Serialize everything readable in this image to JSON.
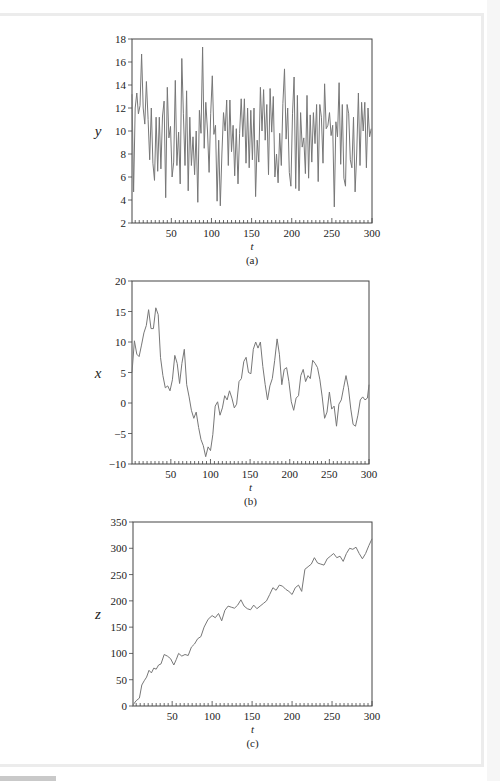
{
  "chart_data": [
    {
      "id": "a",
      "type": "line",
      "caption": "(a)",
      "xlabel": "t",
      "ylabel": "y",
      "xlim": [
        1,
        300
      ],
      "ylim": [
        2,
        18
      ],
      "xticks": [
        50,
        100,
        150,
        200,
        250,
        300
      ],
      "yticks": [
        2,
        4,
        6,
        8,
        10,
        12,
        14,
        16,
        18
      ],
      "grid": false,
      "line_color": "#777777",
      "box": {
        "left": 132,
        "top": 39,
        "right": 372,
        "bottom": 223
      },
      "x": [
        1,
        3,
        5,
        7,
        9,
        11,
        13,
        15,
        17,
        19,
        21,
        23,
        25,
        27,
        29,
        31,
        33,
        35,
        37,
        39,
        41,
        43,
        45,
        47,
        49,
        51,
        53,
        55,
        57,
        59,
        61,
        63,
        65,
        67,
        69,
        71,
        73,
        75,
        77,
        79,
        81,
        83,
        85,
        87,
        89,
        91,
        93,
        95,
        97,
        99,
        101,
        103,
        105,
        107,
        109,
        111,
        113,
        115,
        117,
        119,
        121,
        123,
        125,
        127,
        129,
        131,
        133,
        135,
        137,
        139,
        141,
        143,
        145,
        147,
        149,
        151,
        153,
        155,
        157,
        159,
        161,
        163,
        165,
        167,
        169,
        171,
        173,
        175,
        177,
        179,
        181,
        183,
        185,
        187,
        189,
        191,
        193,
        195,
        197,
        199,
        201,
        203,
        205,
        207,
        209,
        211,
        213,
        215,
        217,
        219,
        221,
        223,
        225,
        227,
        229,
        231,
        233,
        235,
        237,
        239,
        241,
        243,
        245,
        247,
        249,
        251,
        253,
        255,
        257,
        259,
        261,
        263,
        265,
        267,
        269,
        271,
        273,
        275,
        277,
        279,
        281,
        283,
        285,
        287,
        289,
        291,
        293,
        295,
        297,
        299
      ],
      "values": [
        13.2,
        4.7,
        12,
        13.3,
        11.5,
        12.2,
        16.7,
        12,
        10.6,
        14.3,
        11,
        7.5,
        12,
        7.2,
        5.7,
        11.2,
        6.5,
        11.2,
        6.7,
        11.3,
        12.6,
        4.2,
        13.8,
        9.4,
        10.4,
        6,
        7.3,
        14.4,
        7,
        9.9,
        5.4,
        16.3,
        11.5,
        7,
        13.5,
        4.8,
        11.2,
        7,
        9.5,
        6.2,
        10,
        3.8,
        11.8,
        9.8,
        17.3,
        8.5,
        12.5,
        10,
        6.4,
        11.5,
        14.8,
        9.7,
        10.5,
        3.9,
        9.2,
        3.5,
        8,
        11.6,
        10,
        12.7,
        7,
        12.7,
        8.2,
        10.5,
        6.1,
        10.2,
        5.4,
        9.8,
        12.8,
        9.5,
        12.8,
        7.2,
        12,
        6.8,
        11.8,
        7.5,
        12,
        4.3,
        9.2,
        7.3,
        13.8,
        10,
        13.6,
        9.2,
        12.3,
        6.2,
        13.7,
        9.9,
        13,
        6,
        8,
        5.5,
        9.8,
        7,
        12.4,
        15.4,
        9.3,
        12,
        6.4,
        5.2,
        11.5,
        14.7,
        5,
        13.1,
        4.8,
        11.6,
        8.6,
        9.4,
        6.3,
        13.1,
        5.9,
        11.4,
        7.3,
        11.6,
        8.9,
        12.3,
        5.6,
        12.3,
        11.2,
        7.2,
        14.1,
        10.2,
        10.5,
        11.6,
        9.6,
        10.5,
        3.4,
        10.8,
        9.5,
        14.2,
        7.1,
        12.3,
        5.9,
        5.2,
        12.3,
        11.5,
        7.5,
        6.8,
        11.2,
        4.7,
        8,
        13.3,
        7,
        12.5,
        10,
        12.5,
        6.8,
        12,
        9.5,
        10.2,
        3.9,
        10.3,
        6.7,
        8.2
      ]
    },
    {
      "id": "b",
      "type": "line",
      "caption": "(b)",
      "xlabel": "t",
      "ylabel": "x",
      "xlim": [
        1,
        300
      ],
      "ylim": [
        -10,
        20
      ],
      "xticks": [
        50,
        100,
        150,
        200,
        250,
        300
      ],
      "yticks": [
        -10,
        -5,
        0,
        5,
        10,
        15,
        20
      ],
      "grid": false,
      "line_color": "#777777",
      "box": {
        "left": 132,
        "top": 281,
        "right": 369,
        "bottom": 464
      },
      "x": [
        1,
        4,
        7,
        10,
        13,
        16,
        19,
        22,
        25,
        28,
        31,
        34,
        37,
        40,
        43,
        46,
        49,
        52,
        55,
        58,
        61,
        64,
        67,
        70,
        73,
        76,
        79,
        82,
        85,
        88,
        91,
        94,
        97,
        100,
        103,
        106,
        109,
        112,
        115,
        118,
        121,
        124,
        127,
        130,
        133,
        136,
        139,
        142,
        145,
        148,
        151,
        154,
        157,
        160,
        163,
        166,
        169,
        172,
        175,
        178,
        181,
        184,
        187,
        190,
        193,
        196,
        199,
        202,
        205,
        208,
        211,
        214,
        217,
        220,
        223,
        226,
        229,
        232,
        235,
        238,
        241,
        244,
        247,
        250,
        253,
        256,
        259,
        262,
        265,
        268,
        271,
        274,
        277,
        280,
        283,
        286,
        289,
        292,
        295,
        298,
        300
      ],
      "values": [
        5,
        10.2,
        8,
        7.6,
        9.5,
        11.5,
        12.7,
        15.3,
        12.2,
        12.2,
        15.6,
        14.5,
        7.5,
        4.5,
        2.5,
        2.8,
        2,
        3.8,
        7.8,
        6.5,
        3.2,
        6.5,
        8.8,
        3,
        1,
        -1.2,
        -2.5,
        -1.5,
        -4,
        -6,
        -7,
        -8.8,
        -7.2,
        -7.8,
        -5.2,
        -0.5,
        0.2,
        -2,
        -0.8,
        1.2,
        0.5,
        2,
        0.8,
        -0.8,
        -0.2,
        3.5,
        4,
        6.8,
        7.5,
        5,
        4.8,
        8.8,
        10,
        9,
        10,
        6,
        3,
        0.5,
        2.8,
        4,
        7,
        10.5,
        8,
        3,
        5.5,
        5.8,
        3.5,
        0.2,
        -1.2,
        0.8,
        1.2,
        4.5,
        5.5,
        3.5,
        4.5,
        4,
        7,
        6.5,
        5.8,
        3.8,
        1,
        -2.5,
        -1.5,
        1.8,
        -1,
        -0.5,
        -3.8,
        -0.2,
        0.5,
        2.5,
        4.5,
        2.5,
        -1,
        -3.5,
        -3.8,
        -2,
        0.5,
        1,
        0.5,
        0.8,
        3
      ]
    },
    {
      "id": "c",
      "type": "line",
      "caption": "(c)",
      "xlabel": "t",
      "ylabel": "z",
      "xlim": [
        1,
        300
      ],
      "ylim": [
        0,
        350
      ],
      "xticks": [
        50,
        100,
        150,
        200,
        250,
        300
      ],
      "yticks": [
        0,
        50,
        100,
        150,
        200,
        250,
        300,
        350
      ],
      "grid": false,
      "line_color": "#777777",
      "box": {
        "left": 133,
        "top": 522,
        "right": 372,
        "bottom": 706
      },
      "x": [
        1,
        5,
        9,
        12,
        15,
        18,
        21,
        24,
        27,
        30,
        33,
        36,
        40,
        44,
        48,
        52,
        55,
        58,
        62,
        66,
        70,
        74,
        78,
        82,
        86,
        90,
        95,
        100,
        104,
        108,
        112,
        116,
        120,
        124,
        128,
        132,
        136,
        140,
        144,
        148,
        152,
        156,
        160,
        164,
        168,
        172,
        176,
        180,
        184,
        188,
        192,
        196,
        200,
        204,
        208,
        212,
        216,
        220,
        224,
        228,
        232,
        236,
        240,
        244,
        248,
        252,
        256,
        260,
        264,
        268,
        272,
        276,
        280,
        284,
        288,
        292,
        296,
        300
      ],
      "values": [
        2,
        10,
        15,
        40,
        48,
        55,
        68,
        63,
        72,
        70,
        78,
        80,
        98,
        95,
        90,
        78,
        88,
        100,
        95,
        98,
        96,
        112,
        118,
        128,
        132,
        150,
        165,
        172,
        168,
        176,
        162,
        182,
        190,
        188,
        186,
        192,
        202,
        190,
        185,
        183,
        192,
        185,
        190,
        195,
        200,
        212,
        225,
        220,
        230,
        228,
        222,
        218,
        212,
        225,
        230,
        218,
        260,
        265,
        270,
        282,
        272,
        270,
        268,
        280,
        285,
        290,
        282,
        285,
        275,
        290,
        300,
        298,
        302,
        290,
        280,
        290,
        305,
        318
      ]
    }
  ]
}
